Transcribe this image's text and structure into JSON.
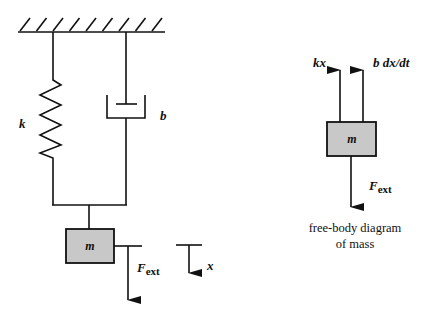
{
  "diagram": {
    "system": {
      "spring_label": "k",
      "damper_label": "b",
      "mass_label": "m",
      "force_label": "F",
      "force_subscript": "ext",
      "displacement_label": "x"
    },
    "free_body": {
      "mass_label": "m",
      "spring_force_label": "kx",
      "damper_force_label": "b dx/dt",
      "external_force_label": "F",
      "external_force_subscript": "ext",
      "caption_line1": "free-body diagram",
      "caption_line2": "of mass"
    },
    "colors": {
      "mass_fill": "#c8c8c8",
      "line": "#111111"
    }
  }
}
